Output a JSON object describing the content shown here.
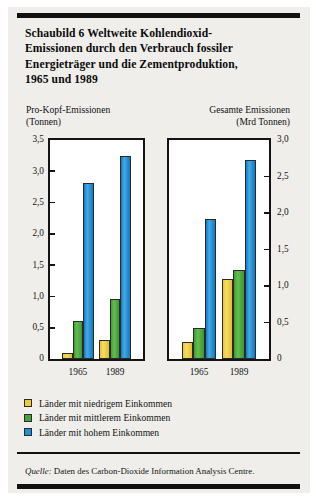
{
  "title": {
    "lines": [
      "Schaubild 6   Weltweite Kohlendioxid-",
      "Emissionen durch den Verbrauch fossiler",
      "Energieträger und die Zementproduktion,",
      "1965 und 1989"
    ]
  },
  "panels": {
    "left": {
      "header_line1": "Pro-Kopf-Emissionen",
      "header_line2": "(Tonnen)"
    },
    "right": {
      "header_line1": "Gesamte Emissionen",
      "header_line2": "(Mrd Tonnen)"
    }
  },
  "legend": {
    "items": [
      {
        "label": "Länder mit niedrigem Einkommen",
        "color": "#edcb3c"
      },
      {
        "label": "Länder mit mittlerem Einkommen",
        "color": "#45a23a"
      },
      {
        "label": "Länder mit hohem Einkommen",
        "color": "#1f8ed6"
      }
    ]
  },
  "source": {
    "prefix": "Quelle:",
    "text": " Daten des Carbon-Dioxide Information Analysis Centre."
  },
  "colors": {
    "yellow": "#edcb3c",
    "green": "#45a23a",
    "blue": "#1f8ed6",
    "ink": "#111111",
    "paper": "#efeeea"
  },
  "chart_data": [
    {
      "type": "bar",
      "id": "pro-kopf-emissionen",
      "title": "Pro-Kopf-Emissionen (Tonnen)",
      "xlabel": "",
      "ylabel": "Tonnen",
      "ylim": [
        0,
        3.5
      ],
      "yticks": [
        0,
        0.5,
        1.0,
        1.5,
        2.0,
        2.5,
        3.0,
        3.5
      ],
      "ytick_labels": [
        "0",
        "0,5",
        "1,0",
        "1,5",
        "2,0",
        "2,5",
        "3,0",
        "3,5"
      ],
      "categories": [
        "1965",
        "1989"
      ],
      "grid": false,
      "legend_position": "below",
      "series": [
        {
          "name": "Länder mit niedrigem Einkommen",
          "color": "#edcb3c",
          "values": [
            0.1,
            0.3
          ]
        },
        {
          "name": "Länder mit mittlerem Einkommen",
          "color": "#45a23a",
          "values": [
            0.6,
            0.96
          ]
        },
        {
          "name": "Länder mit hohem Einkommen",
          "color": "#1f8ed6",
          "values": [
            2.82,
            3.25
          ]
        }
      ]
    },
    {
      "type": "bar",
      "id": "gesamte-emissionen",
      "title": "Gesamte Emissionen (Mrd Tonnen)",
      "xlabel": "",
      "ylabel": "Mrd Tonnen",
      "ylim": [
        0,
        3.0
      ],
      "yticks": [
        0,
        0.5,
        1.0,
        1.5,
        2.0,
        2.5,
        3.0
      ],
      "ytick_labels": [
        "0",
        "0,5",
        "1,0",
        "1,5",
        "2,0",
        "2,5",
        "3,0"
      ],
      "categories": [
        "1965",
        "1989"
      ],
      "grid": false,
      "legend_position": "below",
      "series": [
        {
          "name": "Länder mit niedrigem Einkommen",
          "color": "#edcb3c",
          "values": [
            0.23,
            1.1
          ]
        },
        {
          "name": "Länder mit mittlerem Einkommen",
          "color": "#45a23a",
          "values": [
            0.42,
            1.22
          ]
        },
        {
          "name": "Länder mit hohem Einkommen",
          "color": "#1f8ed6",
          "values": [
            1.92,
            2.72
          ]
        }
      ]
    }
  ]
}
